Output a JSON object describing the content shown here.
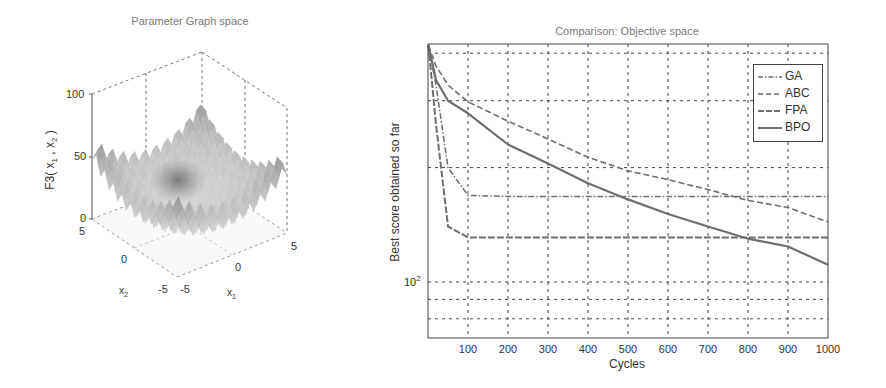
{
  "chart_data": [
    {
      "type": "surface3d",
      "title": "Parameter Graph space",
      "xlabel": "x1",
      "ylabel": "x2",
      "zlabel": "F3( x1 , x2 )",
      "x_ticks": [
        "-5",
        "0",
        "5"
      ],
      "y_ticks": [
        "-5",
        "0",
        "5"
      ],
      "z_ticks": [
        "0",
        "50",
        "100"
      ],
      "xlim": [
        -5,
        5
      ],
      "ylim": [
        -5,
        5
      ],
      "zlim": [
        0,
        100
      ],
      "grid": true,
      "colormap": "grayscale"
    },
    {
      "type": "line",
      "title": "Comparison: Objective space",
      "xlabel": "Cycles",
      "ylabel": "Best score obtained so far",
      "yscale": "log",
      "xlim": [
        0,
        1000
      ],
      "ylim": [
        70,
        430
      ],
      "x_ticks": [
        "100",
        "200",
        "300",
        "400",
        "500",
        "600",
        "700",
        "800",
        "900",
        "1000"
      ],
      "y_tick_label": "10^2",
      "grid": true,
      "legend_position": "northeast",
      "x": [
        1,
        20,
        50,
        100,
        200,
        300,
        400,
        500,
        600,
        700,
        800,
        900,
        1000
      ],
      "series": [
        {
          "name": "GA",
          "style": "dash-dot",
          "values": [
            420,
            330,
            200,
            169,
            168,
            168,
            168,
            168,
            168,
            168,
            168,
            168,
            168
          ]
        },
        {
          "name": "ABC",
          "style": "dashed",
          "values": [
            420,
            370,
            330,
            298,
            265,
            238,
            213,
            196,
            186,
            175,
            164,
            157,
            144
          ]
        },
        {
          "name": "FPA",
          "style": "dashed-heavy",
          "values": [
            420,
            260,
            140,
            131,
            131,
            131,
            131,
            131,
            131,
            131,
            131,
            131,
            131
          ]
        },
        {
          "name": "BPO",
          "style": "solid",
          "values": [
            420,
            340,
            300,
            278,
            230,
            205,
            182,
            165,
            151,
            140,
            130,
            124,
            111
          ]
        }
      ]
    }
  ],
  "left_chart": {
    "title": "Parameter Graph space",
    "zlabel_main": "F3( x",
    "zlabel_sub1": "1",
    "zlabel_mid": " , x",
    "zlabel_sub2": "2",
    "zlabel_end": " )",
    "z_ticks": [
      "100",
      "50",
      "0"
    ],
    "x2_ticks": [
      "5",
      "0",
      "-5"
    ],
    "x1_ticks": [
      "-5",
      "0",
      "5"
    ],
    "x1_label": "x",
    "x1_sub": "1",
    "x2_label": "x",
    "x2_sub": "2"
  },
  "right_chart": {
    "title": "Comparison: Objective space",
    "xlabel": "Cycles",
    "ylabel": "Best score obtained so far",
    "y_tick_base": "10",
    "y_tick_exp": "2",
    "x_ticks": [
      "100",
      "200",
      "300",
      "400",
      "500",
      "600",
      "700",
      "800",
      "900",
      "1000"
    ],
    "legend": [
      "GA",
      "ABC",
      "FPA",
      "BPO"
    ],
    "line_color": "#6e6e6e"
  }
}
